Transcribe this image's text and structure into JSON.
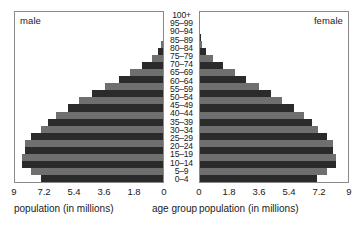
{
  "figure": {
    "center_axis_title": "age group",
    "left_panel_label": "male",
    "right_panel_label": "female",
    "left_axis_title": "population (in millions)",
    "right_axis_title": "population (in millions)",
    "bar_color_dark": "#2b2b2b",
    "bar_color_light": "#6f6f6f",
    "panel_border_color": "#8a8a8a",
    "background_color": "#ffffff"
  },
  "chart_data": {
    "type": "bar",
    "subtype": "population-pyramid",
    "title": "",
    "xlabel": "population (in millions)",
    "ylabel": "age group",
    "grid": false,
    "legend": [
      "male",
      "female"
    ],
    "legend_position": "panel-corners",
    "xlim": [
      0,
      9
    ],
    "left_ticks": [
      "9",
      "7.2",
      "5.4",
      "3.6",
      "1.8",
      "0"
    ],
    "right_ticks": [
      "0",
      "1.8",
      "3.6",
      "5.4",
      "7.2",
      "9"
    ],
    "left_tick_values": [
      9,
      7.2,
      5.4,
      3.6,
      1.8,
      0
    ],
    "right_tick_values": [
      0,
      1.8,
      3.6,
      5.4,
      7.2,
      9
    ],
    "categories": [
      "100+",
      "95–99",
      "90–94",
      "85–89",
      "80–84",
      "75–79",
      "70–74",
      "65–69",
      "60–64",
      "55–59",
      "50–54",
      "45–49",
      "40–44",
      "35–39",
      "30–34",
      "25–29",
      "20–24",
      "15–19",
      "10–14",
      "5–9",
      "0–4"
    ],
    "series": [
      {
        "name": "male",
        "side": "left",
        "values": [
          0.02,
          0.1,
          0.3,
          0.7,
          1.3,
          2.0,
          2.7,
          3.5,
          4.3,
          5.1,
          5.8,
          6.5,
          7.0,
          7.4,
          8.0,
          8.4,
          8.4,
          8.6,
          8.6,
          8.0,
          7.4
        ]
      },
      {
        "name": "female",
        "side": "right",
        "values": [
          0.03,
          0.12,
          0.35,
          0.8,
          1.4,
          2.1,
          2.8,
          3.6,
          4.3,
          5.0,
          5.7,
          6.3,
          6.8,
          7.2,
          7.7,
          8.1,
          8.1,
          8.3,
          8.3,
          7.7,
          7.1
        ]
      }
    ]
  }
}
